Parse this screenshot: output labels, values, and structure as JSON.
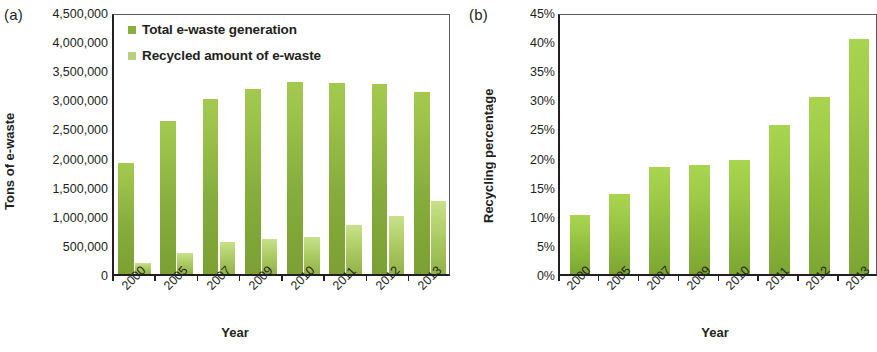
{
  "figure": {
    "panels": [
      {
        "letter": "(a)",
        "ylabel": "Tons of e-waste",
        "xlabel": "Year"
      },
      {
        "letter": "(b)",
        "ylabel": "Recycling percentage",
        "xlabel": "Year"
      }
    ]
  },
  "legend": {
    "items": [
      {
        "label": "Total e-waste generation",
        "color": "#8aae3f",
        "marker": "square-icon"
      },
      {
        "label": "Recycled amount of e-waste",
        "color": "#b9cd84",
        "marker": "square-icon"
      }
    ]
  },
  "axis_a": {
    "ticks": [
      "4,500,000",
      "4,000,000",
      "3,500,000",
      "3,000,000",
      "2,500,000",
      "2,000,000",
      "1,500,000",
      "1,000,000",
      "500,000",
      "0"
    ]
  },
  "axis_b": {
    "ticks": [
      "45%",
      "40%",
      "35%",
      "30%",
      "25%",
      "20%",
      "15%",
      "10%",
      "5%",
      "0%"
    ]
  },
  "chart_data": [
    {
      "type": "bar",
      "title": "",
      "panel": "(a)",
      "categories": [
        "2000",
        "2005",
        "2007",
        "2009",
        "2010",
        "2011",
        "2012",
        "2013"
      ],
      "series": [
        {
          "name": "Total e-waste generation",
          "values": [
            1900000,
            2630000,
            3010000,
            3180000,
            3300000,
            3280000,
            3260000,
            3120000
          ],
          "color": "#8aae3f"
        },
        {
          "name": "Recycled amount of e-waste",
          "values": [
            190000,
            360000,
            550000,
            600000,
            640000,
            840000,
            990000,
            1260000
          ],
          "color": "#b9cd84"
        }
      ],
      "xlabel": "Year",
      "ylabel": "Tons of e-waste",
      "ylim": [
        0,
        4500000
      ],
      "ytick_step": 500000,
      "grid": false,
      "legend_position": "top-left"
    },
    {
      "type": "bar",
      "title": "",
      "panel": "(b)",
      "categories": [
        "2000",
        "2005",
        "2007",
        "2009",
        "2010",
        "2011",
        "2012",
        "2013"
      ],
      "series": [
        {
          "name": "Recycling percentage",
          "values": [
            10.1,
            13.8,
            18.3,
            18.8,
            19.6,
            25.6,
            30.4,
            40.3
          ],
          "color": "#9ac83f"
        }
      ],
      "xlabel": "Year",
      "ylabel": "Recycling percentage",
      "ylim": [
        0,
        45
      ],
      "ytick_step": 5,
      "grid": false,
      "legend_position": "none"
    }
  ]
}
